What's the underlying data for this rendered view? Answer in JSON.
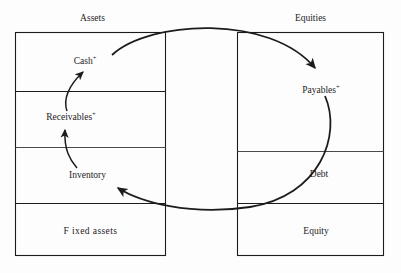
{
  "diagram": {
    "title_left": "Assets",
    "title_right": "Equities",
    "assets": {
      "rows": [
        {
          "name": "cash",
          "label": "Cash",
          "superscript": "+"
        },
        {
          "name": "receivables",
          "label": "Receivables",
          "superscript": "+"
        },
        {
          "name": "inventory",
          "label": "Inventory",
          "superscript": ""
        },
        {
          "name": "fixed-assets",
          "label": "F ixed assets",
          "superscript": ""
        }
      ]
    },
    "equities": {
      "rows": [
        {
          "name": "payables",
          "label": "Payables",
          "superscript": "+"
        },
        {
          "name": "debt",
          "label": "Debt",
          "superscript": ""
        },
        {
          "name": "equity",
          "label": "Equity",
          "superscript": ""
        }
      ]
    },
    "flows": [
      {
        "name": "inventory-to-receivables",
        "from": "Inventory",
        "to": "Receivables"
      },
      {
        "name": "receivables-to-cash",
        "from": "Receivables",
        "to": "Cash"
      },
      {
        "name": "cash-to-payables",
        "from": "Cash",
        "to": "Payables"
      },
      {
        "name": "payables-to-inventory",
        "from": "Payables",
        "to": "Inventory"
      }
    ],
    "colors": {
      "stroke": "#1c1c1c",
      "background": "#fdfdfd",
      "text": "#1c1c1c"
    }
  }
}
